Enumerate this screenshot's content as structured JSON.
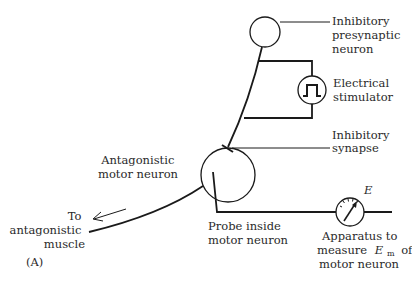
{
  "figure": {
    "panel_label": "(A)",
    "labels": {
      "presynaptic": [
        "Inhibitory",
        "presynaptic",
        "neuron"
      ],
      "stimulator": [
        "Electrical",
        "stimulator"
      ],
      "synapse": [
        "Inhibitory",
        "synapse"
      ],
      "motor_neuron": [
        "Antagonistic",
        "motor neuron"
      ],
      "muscle": [
        "To",
        "antagonistic",
        "muscle"
      ],
      "probe": [
        "Probe inside",
        "motor neuron"
      ],
      "apparatus": [
        "Apparatus to",
        "measure",
        "E",
        "m",
        "of",
        "motor neuron"
      ],
      "meter_symbol": "E"
    },
    "colors": {
      "stroke": "#1a1a1a",
      "text": "#2a2a2a",
      "background": "#ffffff"
    }
  }
}
